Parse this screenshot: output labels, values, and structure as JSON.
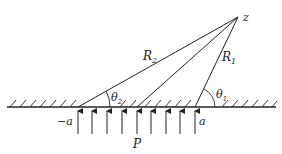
{
  "figure": {
    "labels": {
      "point": "z",
      "r1": "R",
      "r1_sub": "1",
      "r2": "R",
      "r2_sub": "2",
      "theta1": "θ",
      "theta1_sub": "1",
      "theta2": "θ",
      "theta2_sub": "2",
      "neg_a": "−a",
      "pos_a": "a",
      "load": "P"
    },
    "colors": {
      "stroke": "#222222",
      "background": "#ffffff"
    },
    "arrows_count": 9
  }
}
